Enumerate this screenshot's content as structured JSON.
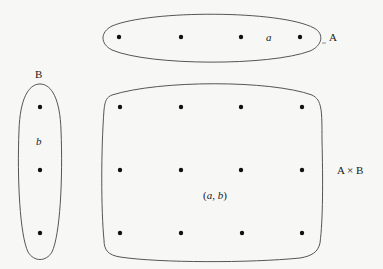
{
  "set_a": {
    "label": "A",
    "element_label": "a",
    "points": [
      [
        119,
        37
      ],
      [
        181,
        37
      ],
      [
        241,
        37
      ],
      [
        300,
        37
      ]
    ]
  },
  "set_b": {
    "label": "B",
    "element_label": "b",
    "points": [
      [
        40,
        107
      ],
      [
        40,
        170
      ],
      [
        40,
        233
      ]
    ]
  },
  "product": {
    "label": "A × B",
    "element_label": "(a, b)",
    "points": [
      [
        120,
        107
      ],
      [
        181,
        107
      ],
      [
        241,
        107
      ],
      [
        302,
        107
      ],
      [
        120,
        170
      ],
      [
        181,
        170
      ],
      [
        241,
        170
      ],
      [
        302,
        170
      ],
      [
        120,
        233
      ],
      [
        181,
        233
      ],
      [
        242,
        233
      ],
      [
        302,
        233
      ]
    ]
  },
  "colors": {
    "stroke": "#555555",
    "dot": "#111111",
    "background": "#f7f7f5"
  }
}
